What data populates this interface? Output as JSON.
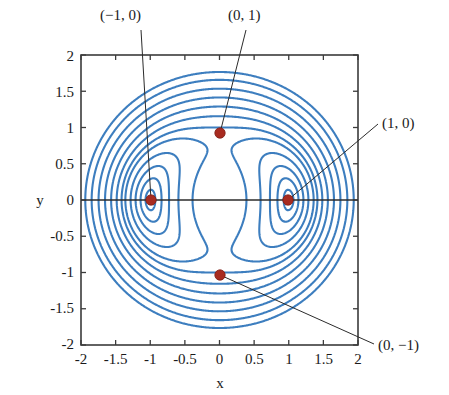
{
  "figure": {
    "kind": "contour-plot",
    "background_color": "#ffffff",
    "plot_frame_color": "#3b3b3b",
    "contour_color": "#3d7ebf",
    "marker_color": "#a82b20",
    "leader_line_color": "#2b2b2b"
  },
  "axes": {
    "x_label": "x",
    "y_label": "y",
    "x_ticks": [
      "-2",
      "-1.5",
      "-1",
      "-0.5",
      "0",
      "0.5",
      "1",
      "1.5",
      "2"
    ],
    "y_ticks": [
      "2",
      "1.5",
      "1",
      "0.5",
      "0",
      "-0.5",
      "-1",
      "-1.5",
      "-2"
    ]
  },
  "annotations": [
    {
      "id": "center-left",
      "label": "(−1, 0)"
    },
    {
      "id": "saddle-top",
      "label": "(0, 1)"
    },
    {
      "id": "center-right",
      "label": "(1, 0)"
    },
    {
      "id": "saddle-bottom",
      "label": "(0, −1)"
    }
  ],
  "chart_data": {
    "type": "line",
    "title": "",
    "xlabel": "x",
    "ylabel": "y",
    "xlim": [
      -2,
      2
    ],
    "ylim": [
      -2,
      2
    ],
    "xticks": [
      -2,
      -1.5,
      -1,
      -0.5,
      0,
      0.5,
      1,
      1.5,
      2
    ],
    "yticks": [
      -2,
      -1.5,
      -1,
      -0.5,
      0,
      0.5,
      1,
      1.5,
      2
    ],
    "grid": false,
    "legend": "none",
    "plot_kind": "contour",
    "field_expression": "x^2*(x^2-2) + y^2*(y^2-2) + 2*x^2*y^2",
    "contour_levels": [
      -1.75,
      -1.5,
      -1.2,
      -0.85,
      -0.5,
      0,
      0.6,
      1.6,
      3.0,
      5.0,
      8.0
    ],
    "critical_points": [
      {
        "name": "center-left",
        "x": -1,
        "y": 0,
        "type": "center",
        "label": "(−1, 0)"
      },
      {
        "name": "center-right",
        "x": 1,
        "y": 0,
        "type": "center",
        "label": "(1, 0)"
      },
      {
        "name": "saddle-top",
        "x": 0,
        "y": 1,
        "type": "saddle",
        "label": "(0, 1)"
      },
      {
        "name": "saddle-bottom",
        "x": 0,
        "y": -1,
        "type": "saddle",
        "label": "(0, −1)"
      }
    ],
    "reference_lines": [
      {
        "name": "x-axis-line",
        "orientation": "horizontal",
        "value": 0
      }
    ],
    "annotation_leaders": [
      {
        "from_label": "(−1, 0)",
        "to_point": [
          -1,
          0
        ]
      },
      {
        "from_label": "(0, 1)",
        "to_point": [
          0,
          1
        ]
      },
      {
        "from_label": "(1, 0)",
        "to_point": [
          1,
          0
        ]
      },
      {
        "from_label": "(0, −1)",
        "to_point": [
          0,
          -1
        ]
      }
    ]
  }
}
